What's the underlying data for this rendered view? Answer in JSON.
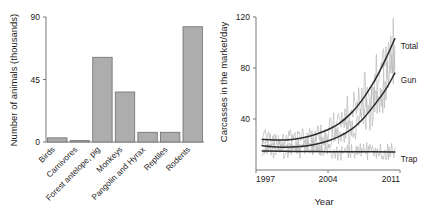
{
  "figure": {
    "panels": [
      "left-bar-chart",
      "right-line-chart"
    ]
  },
  "colors": {
    "bar_fill": "#adadad",
    "bar_stroke": "#6e6e6e",
    "axis": "#777777",
    "raw_series": "#b9b9b9",
    "trend": "#2b2b2b",
    "text": "#1a1a1a",
    "background": "#ffffff"
  },
  "chart_data": [
    {
      "id": "left-bar-chart",
      "type": "bar",
      "title": "",
      "xlabel": "",
      "ylabel": "Number of animals (thousands)",
      "ylim": [
        0,
        90
      ],
      "yticks": [
        0,
        45,
        90
      ],
      "ytick_labels": [
        "0",
        "45",
        "90"
      ],
      "grid": false,
      "legend": "none",
      "categories": [
        "Birds",
        "Carnivores",
        "Forest antelope, pig",
        "Monkeys",
        "Pangolin and Hyrax",
        "Reptiles",
        "Rodents"
      ],
      "values": [
        3,
        1,
        61,
        36,
        7,
        7,
        83
      ],
      "tick_label_rotation": -45
    },
    {
      "id": "right-line-chart",
      "type": "line",
      "title": "",
      "xlabel": "Year",
      "ylabel": "Carcasses in the market/day",
      "xlim": [
        1997,
        2011
      ],
      "ylim": [
        0,
        120
      ],
      "xticks": [
        1997,
        2004,
        2011
      ],
      "xtick_labels": [
        "1997",
        "2004",
        "2011"
      ],
      "yticks": [
        40,
        80,
        120
      ],
      "ytick_labels": [
        "40",
        "80",
        "120"
      ],
      "grid": false,
      "legend": "inline-right",
      "series": [
        {
          "name": "Total",
          "label": "Total",
          "style": "trend",
          "x": [
            1997.6,
            1999,
            2000.5,
            2002,
            2003.5,
            2005,
            2006.3,
            2007.5,
            2008.6,
            2009.6,
            2010.5
          ],
          "values": [
            24,
            23.5,
            24,
            26,
            30,
            36,
            45,
            57,
            71,
            87,
            103
          ]
        },
        {
          "name": "Gun",
          "label": "Gun",
          "style": "trend",
          "x": [
            1997.6,
            1999,
            2000.5,
            2002,
            2003.5,
            2005,
            2006.3,
            2007.5,
            2008.6,
            2009.6,
            2010.5
          ],
          "values": [
            19,
            18,
            18,
            19,
            21.5,
            26,
            32,
            41,
            52,
            63,
            76
          ]
        },
        {
          "name": "Trap",
          "label": "Trap",
          "style": "trend",
          "x": [
            1997.6,
            2000.5,
            2004,
            2007.5,
            2010.5
          ],
          "values": [
            15,
            14.6,
            14.4,
            14.3,
            14.2
          ]
        }
      ],
      "raw_series": [
        {
          "name": "Total observed",
          "note": "monthly noisy record fluctuating around the Total trend, peaks to ~118 near 2010"
        },
        {
          "name": "Gun observed",
          "note": "monthly noisy record fluctuating around the Gun trend"
        },
        {
          "name": "Trap observed",
          "note": "monthly noisy record fluctuating around the flat Trap trend"
        }
      ]
    }
  ]
}
